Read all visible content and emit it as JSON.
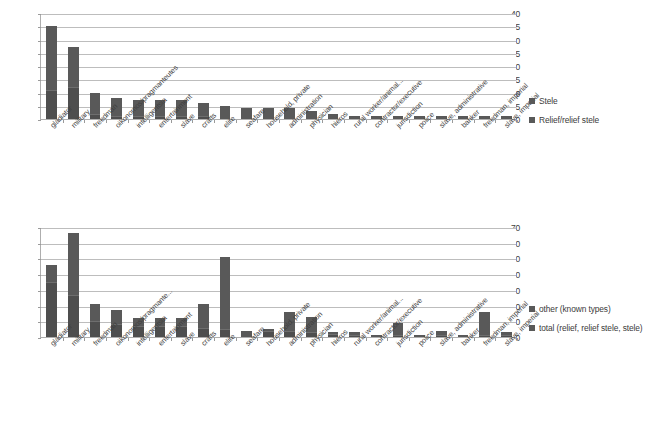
{
  "figure": {
    "caption": ""
  },
  "chart_data": [
    {
      "type": "bar",
      "id": "chart-top",
      "title": "",
      "subtitle": "",
      "xlabel": "",
      "ylabel": "",
      "ylim": [
        0,
        40
      ],
      "yticks": [
        0,
        5,
        10,
        15,
        20,
        25,
        30,
        35,
        40
      ],
      "grid": true,
      "stacked": true,
      "legend_position": "right",
      "legend": [
        "Stele",
        "Relief/relief stele"
      ],
      "categories": [
        "gladiator",
        "military",
        "freedman",
        "oikonomos/pragmanteutes",
        "intelligentsia",
        "entertainment",
        "slave",
        "crafts",
        "elite",
        "seafare",
        "household, private",
        "administration",
        "physician",
        "hieros",
        "rural worker/animal...",
        "contractor/executive",
        "jurisdiction",
        "police",
        "slave, administrative",
        "banker",
        "freedman, imperial",
        "slave, imperial"
      ],
      "series": [
        {
          "name": "Stele",
          "values": [
            11,
            12,
            2,
            1,
            1,
            1,
            1,
            1,
            0,
            0,
            0,
            0,
            0,
            0,
            0,
            0,
            0,
            0,
            0,
            0,
            0,
            0
          ]
        },
        {
          "name": "Relief/relief stele",
          "values": [
            24,
            15,
            8,
            7,
            6,
            6,
            6,
            5,
            5,
            4,
            4,
            4,
            3,
            2,
            1,
            1,
            1,
            1,
            1,
            1,
            1,
            1
          ]
        }
      ],
      "totals": [
        35,
        27,
        10,
        8,
        7,
        7,
        7,
        6,
        5,
        4,
        4,
        4,
        3,
        2,
        1,
        1,
        1,
        1,
        1,
        1,
        1,
        1
      ]
    },
    {
      "type": "bar",
      "id": "chart-bottom",
      "title": "",
      "subtitle": "",
      "xlabel": "",
      "ylabel": "",
      "ylim": [
        0,
        70
      ],
      "yticks": [
        0,
        10,
        20,
        30,
        40,
        50,
        60,
        70
      ],
      "grid": true,
      "stacked": true,
      "legend_position": "right",
      "legend": [
        "other (known types)",
        "total (relief, relief stele, stele)"
      ],
      "categories": [
        "gladiator",
        "military",
        "freedman",
        "oikonomos/pragmante...",
        "intelligentsia",
        "entertainment",
        "slave",
        "crafts",
        "elite",
        "seafare",
        "household, private",
        "administration",
        "physician",
        "hieros",
        "rural worker/animal...",
        "contractor/executive",
        "jurisdiction",
        "police",
        "slave, administrative",
        "banker",
        "freedman, imperial",
        "slave, imperial"
      ],
      "series": [
        {
          "name": "other (known types)",
          "values": [
            35,
            27,
            10,
            8,
            7,
            7,
            7,
            6,
            5,
            4,
            4,
            4,
            3,
            2,
            1,
            1,
            1,
            1,
            1,
            1,
            1,
            1
          ]
        },
        {
          "name": "total (relief, relief stele, stele)",
          "values": [
            11,
            39,
            11,
            9,
            5,
            5,
            5,
            15,
            46,
            0,
            1,
            12,
            9,
            1,
            2,
            0,
            8,
            0,
            3,
            0,
            15,
            2
          ]
        }
      ],
      "totals": [
        46,
        66,
        21,
        17,
        12,
        12,
        12,
        21,
        51,
        4,
        5,
        16,
        13,
        3,
        3,
        1,
        9,
        1,
        4,
        1,
        16,
        3
      ]
    }
  ]
}
